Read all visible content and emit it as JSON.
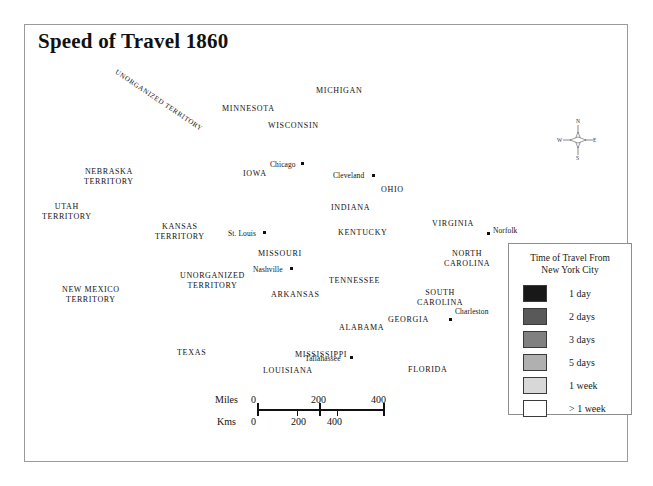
{
  "title": "Speed of Travel 1860",
  "legend": {
    "title_line1": "Time of Travel From",
    "title_line2": "New York City",
    "entries": [
      {
        "label": "1 day",
        "color": "#181818"
      },
      {
        "label": "2 days",
        "color": "#595959"
      },
      {
        "label": "3 days",
        "color": "#808080"
      },
      {
        "label": "5 days",
        "color": "#b0b0b0"
      },
      {
        "label": "1 week",
        "color": "#d8d8d8"
      },
      {
        "label": "> 1 week",
        "color": "#ffffff"
      }
    ]
  },
  "scale": {
    "miles_label": "Miles",
    "kms_label": "Kms",
    "miles_ticks": [
      "0",
      "200",
      "400"
    ],
    "kms_ticks": [
      "0",
      "200",
      "400"
    ]
  },
  "compass": {
    "n": "N",
    "s": "S",
    "e": "E",
    "w": "W"
  },
  "states": [
    {
      "name": "MINNESOTA",
      "x": 222,
      "y": 104,
      "cls": "state"
    },
    {
      "name": "WISCONSIN",
      "x": 268,
      "y": 121,
      "cls": "state"
    },
    {
      "name": "IOWA",
      "x": 243,
      "y": 169,
      "cls": "state"
    },
    {
      "name": "MICHIGAN",
      "x": 316,
      "y": 86,
      "cls": "state"
    },
    {
      "name": "INDIANA",
      "x": 331,
      "y": 203,
      "cls": "state"
    },
    {
      "name": "OHIO",
      "x": 381,
      "y": 185,
      "cls": "state"
    },
    {
      "name": "MISSOURI",
      "x": 258,
      "y": 249,
      "cls": "state"
    },
    {
      "name": "KENTUCKY",
      "x": 338,
      "y": 228,
      "cls": "state"
    },
    {
      "name": "TENNESSEE",
      "x": 329,
      "y": 276,
      "cls": "state"
    },
    {
      "name": "ARKANSAS",
      "x": 271,
      "y": 290,
      "cls": "state"
    },
    {
      "name": "MISSISSIPPI",
      "x": 295,
      "y": 350,
      "cls": "state"
    },
    {
      "name": "ALABAMA",
      "x": 339,
      "y": 323,
      "cls": "state"
    },
    {
      "name": "GEORGIA",
      "x": 388,
      "y": 315,
      "cls": "state"
    },
    {
      "name": "LOUISIANA",
      "x": 263,
      "y": 366,
      "cls": "state"
    },
    {
      "name": "FLORIDA",
      "x": 408,
      "y": 365,
      "cls": "state"
    },
    {
      "name": "TEXAS",
      "x": 177,
      "y": 348,
      "cls": "state"
    },
    {
      "name": "VIRGINIA",
      "x": 432,
      "y": 219,
      "cls": "state"
    },
    {
      "name": "PENNSYLVANIA",
      "x": 429,
      "y": 176,
      "cls": "state white"
    }
  ],
  "states_multiline": [
    {
      "line1": "NORTH",
      "line2": "CAROLINA",
      "x": 444,
      "y": 249
    },
    {
      "line1": "SOUTH",
      "line2": "CAROLINA",
      "x": 417,
      "y": 288
    }
  ],
  "territories": [
    {
      "line1": "NEBRASKA",
      "line2": "TERRITORY",
      "x": 84,
      "y": 167
    },
    {
      "line1": "UTAH",
      "line2": "TERRITORY",
      "x": 42,
      "y": 202
    },
    {
      "line1": "KANSAS",
      "line2": "TERRITORY",
      "x": 155,
      "y": 222
    },
    {
      "line1": "NEW MEXICO",
      "line2": "TERRITORY",
      "x": 62,
      "y": 285
    },
    {
      "line1": "UNORGANIZED",
      "line2": "TERRITORY",
      "x": 180,
      "y": 271
    }
  ],
  "territory_rotated": {
    "name": "UNORGANIZED TERRITORY",
    "x": 118,
    "y": 68
  },
  "abbrevs": [
    {
      "name": "MAINE",
      "x": 528,
      "y": 60,
      "white": true
    },
    {
      "name": "VT",
      "x": 496,
      "y": 94,
      "white": true
    },
    {
      "name": "NH",
      "x": 512,
      "y": 110,
      "white": true
    },
    {
      "name": "MASS.",
      "x": 505,
      "y": 127,
      "white": true
    },
    {
      "name": "CONN.",
      "x": 503,
      "y": 141,
      "white": true
    },
    {
      "name": "R.I.",
      "x": 527,
      "y": 147,
      "white": true
    },
    {
      "name": "NEW YORK",
      "x": 454,
      "y": 131,
      "white": true
    },
    {
      "name": "N.J.",
      "x": 496,
      "y": 183,
      "white": true
    },
    {
      "name": "MD.",
      "x": 470,
      "y": 192,
      "white": true
    },
    {
      "name": "DEL.",
      "x": 496,
      "y": 200,
      "white": true
    }
  ],
  "cities": [
    {
      "name": "Chicago",
      "x": 301,
      "y": 162,
      "dx": 31,
      "dy": 3,
      "white": false,
      "anchor": "right"
    },
    {
      "name": "Cleveland",
      "x": 372,
      "y": 174,
      "dx": 39,
      "dy": 2,
      "white": false,
      "anchor": "right"
    },
    {
      "name": "St. Louis",
      "x": 263,
      "y": 231,
      "dx": 35,
      "dy": 3,
      "white": false,
      "anchor": "right"
    },
    {
      "name": "Nashville",
      "x": 290,
      "y": 267,
      "dx": 37,
      "dy": 3,
      "white": false,
      "anchor": "right"
    },
    {
      "name": "Tallahassee",
      "x": 350,
      "y": 356,
      "dx": 45,
      "dy": 3,
      "white": false,
      "anchor": "right"
    },
    {
      "name": "Charleston",
      "x": 449,
      "y": 318,
      "dx": -7,
      "dy": -6,
      "white": false,
      "anchor": "left"
    },
    {
      "name": "Norfolk",
      "x": 487,
      "y": 232,
      "dx": -7,
      "dy": -1,
      "white": false,
      "anchor": "left"
    },
    {
      "name": "Boston",
      "x": 533,
      "y": 120,
      "dx": -7,
      "dy": -1,
      "white": true,
      "anchor": "left"
    },
    {
      "name": "New York",
      "x": 463,
      "y": 155,
      "dx": 33,
      "dy": 3,
      "white": true,
      "anchor": "right"
    }
  ]
}
